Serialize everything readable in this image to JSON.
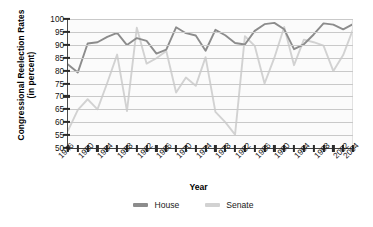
{
  "chart_data": {
    "type": "line",
    "title": "",
    "xlabel": "Year",
    "ylabel": "Congressional Reelection Rates (in percent)",
    "ylabel_line1": "Congressional Reelection Rates",
    "ylabel_line2": "(in percent)",
    "ylim": [
      50,
      100
    ],
    "ytick_values": [
      50,
      55,
      60,
      65,
      70,
      75,
      80,
      85,
      90,
      95,
      100
    ],
    "ytick_labels": [
      "50",
      "55",
      "60",
      "65",
      "70",
      "75",
      "80",
      "85",
      "90",
      "95",
      "100"
    ],
    "grid": true,
    "legend_position": "bottom-center",
    "x": [
      1946,
      1948,
      1950,
      1952,
      1954,
      1956,
      1958,
      1960,
      1962,
      1964,
      1966,
      1968,
      1970,
      1972,
      1974,
      1976,
      1978,
      1980,
      1982,
      1984,
      1986,
      1988,
      1990,
      1992,
      1994,
      1996,
      1998,
      2000,
      2002,
      2004
    ],
    "xtick_values": [
      1946,
      1948,
      1950,
      1952,
      1954,
      1956,
      1958,
      1960,
      1962,
      1964,
      1966,
      1968,
      1970,
      1972,
      1974,
      1976,
      1978,
      1980,
      1982,
      1984,
      1986,
      1988,
      1990,
      1992,
      1994,
      1996,
      1998,
      2000,
      2002,
      2004
    ],
    "xtick_labels": [
      "1946",
      "",
      "1950",
      "",
      "1954",
      "",
      "1958",
      "",
      "1962",
      "",
      "1966",
      "",
      "1970",
      "",
      "1974",
      "",
      "1978",
      "",
      "1982",
      "",
      "1986",
      "",
      "1990",
      "",
      "1994",
      "",
      "1998",
      "",
      "2002",
      "2004"
    ],
    "series": [
      {
        "name": "House",
        "color": "#8c8c8c",
        "values": [
          82.4,
          79.3,
          90.5,
          91.0,
          93.1,
          94.6,
          89.9,
          92.6,
          91.5,
          86.6,
          88.1,
          96.8,
          94.5,
          93.6,
          87.7,
          95.8,
          93.7,
          90.7,
          90.1,
          95.4,
          98.0,
          98.5,
          96.0,
          88.3,
          90.2,
          94.0,
          98.3,
          97.8,
          96.0,
          98.0
        ]
      },
      {
        "name": "Senate",
        "color": "#d2d2d2",
        "values": [
          56.7,
          64.8,
          68.9,
          65.0,
          75.3,
          86.2,
          64.3,
          96.6,
          82.7,
          84.8,
          87.6,
          71.5,
          77.3,
          74.1,
          85.2,
          64.0,
          60.0,
          55.2,
          93.3,
          89.6,
          75.0,
          85.0,
          96.9,
          82.1,
          92.0,
          91.0,
          89.7,
          79.8,
          86.0,
          96.0
        ]
      }
    ]
  },
  "legend": {
    "items": [
      {
        "label": "House",
        "color": "#8c8c8c"
      },
      {
        "label": "Senate",
        "color": "#d2d2d2"
      }
    ]
  }
}
